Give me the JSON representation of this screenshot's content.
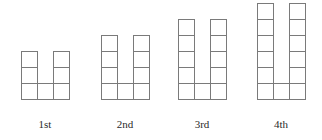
{
  "canvas": {
    "width": 322,
    "height": 140,
    "background": "#ffffff",
    "stroke_color": "#7a7a7a",
    "cell_fill": "#ffffff",
    "label_color": "#2a2a2a"
  },
  "chart_data": {
    "type": "diagram",
    "title": "",
    "subtitle": "",
    "xlabel": "",
    "ylabel": "",
    "shape_name": "U-shape",
    "categories": [
      "1st",
      "2nd",
      "3rd",
      "4th"
    ],
    "values": [
      7,
      9,
      11,
      13
    ],
    "series": [
      {
        "name": "square count",
        "values": [
          7,
          9,
          11,
          13
        ]
      },
      {
        "name": "height in cells",
        "values": [
          3,
          4,
          5,
          6
        ]
      },
      {
        "name": "width in cells",
        "values": [
          3,
          3,
          3,
          3
        ]
      }
    ],
    "cell_size_px": 16,
    "baseline_y_px": 99,
    "legend": [],
    "grid": false,
    "figures": [
      {
        "label": "1st",
        "index": 1,
        "columns": 3,
        "rows": 3,
        "square_count": 7,
        "origin_x": 21,
        "label_x": 45,
        "column_heights": [
          3,
          1,
          3
        ]
      },
      {
        "label": "2nd",
        "index": 2,
        "columns": 3,
        "rows": 4,
        "square_count": 9,
        "origin_x": 101,
        "label_x": 125,
        "column_heights": [
          4,
          1,
          4
        ]
      },
      {
        "label": "3rd",
        "index": 3,
        "columns": 3,
        "rows": 5,
        "square_count": 11,
        "origin_x": 178,
        "label_x": 202,
        "column_heights": [
          5,
          1,
          5
        ]
      },
      {
        "label": "4th",
        "index": 4,
        "columns": 3,
        "rows": 6,
        "square_count": 13,
        "origin_x": 257,
        "label_x": 281,
        "column_heights": [
          6,
          1,
          6
        ]
      }
    ],
    "label_baseline_y": 128,
    "label_font_size": 11
  }
}
